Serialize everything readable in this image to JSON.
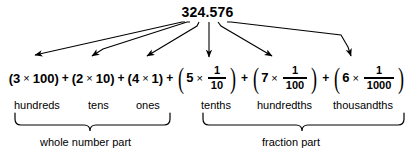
{
  "diagram": {
    "title_number": "324.576",
    "expression": {
      "whole_terms": [
        {
          "open": "(",
          "digit": "3",
          "times": "×",
          "value": "100",
          "close": ")"
        },
        {
          "open": "(",
          "digit": "2",
          "times": "×",
          "value": "10",
          "close": ")"
        },
        {
          "open": "(",
          "digit": "4",
          "times": "×",
          "value": "1",
          "close": ")"
        }
      ],
      "fraction_terms": [
        {
          "open": "(",
          "digit": "5",
          "times": "×",
          "numerator": "1",
          "denominator": "10",
          "close": ")"
        },
        {
          "open": "(",
          "digit": "7",
          "times": "×",
          "numerator": "1",
          "denominator": "100",
          "close": ")"
        },
        {
          "open": "(",
          "digit": "6",
          "times": "×",
          "numerator": "1",
          "denominator": "1000",
          "close": ")"
        }
      ],
      "plus_sign": "+"
    },
    "place_labels": [
      {
        "text": "hundreds",
        "x": 14
      },
      {
        "text": "tens",
        "x": 84
      },
      {
        "text": "ones",
        "x": 135
      },
      {
        "text": "tenths",
        "x": 200
      },
      {
        "text": "hundredths",
        "x": 259
      },
      {
        "text": "thousandths",
        "x": 334
      }
    ],
    "part_labels": [
      {
        "text": "whole number part",
        "x": 40
      },
      {
        "text": "fraction part",
        "x": 260
      }
    ],
    "colors": {
      "background": "#ffffff",
      "ink": "#000000"
    }
  }
}
